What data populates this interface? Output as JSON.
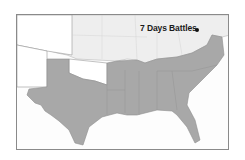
{
  "map": {
    "marker": {
      "label": "7 Days Battles",
      "icon": "point-marker-icon"
    },
    "colors": {
      "confederacy_fill": "#a8a8a8",
      "union_fill": "#eeeeee",
      "territory_fill": "#ffffff",
      "border": "#8a8a8a"
    },
    "regions": [
      "Confederate States (shaded)",
      "Union States",
      "Western Territories"
    ]
  }
}
